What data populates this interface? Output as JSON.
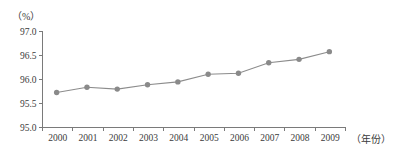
{
  "chart_data": {
    "type": "line",
    "title": "",
    "subtitle": "",
    "xlabel": "（年份）",
    "ylabel": "（%）",
    "categories": [
      "2000",
      "2001",
      "2002",
      "2003",
      "2004",
      "2005",
      "2006",
      "2007",
      "2008",
      "2009"
    ],
    "x": [
      2000,
      2001,
      2002,
      2003,
      2004,
      2005,
      2006,
      2007,
      2008,
      2009
    ],
    "values": [
      95.73,
      95.84,
      95.8,
      95.89,
      95.95,
      96.11,
      96.13,
      96.35,
      96.42,
      96.58
    ],
    "series": [
      {
        "name": "",
        "values": [
          95.73,
          95.84,
          95.8,
          95.89,
          95.95,
          96.11,
          96.13,
          96.35,
          96.42,
          96.58
        ]
      }
    ],
    "ylim": [
      95.0,
      97.0
    ],
    "yticks": [
      "95.0",
      "95.5",
      "96.0",
      "96.5",
      "97.0"
    ],
    "ytick_values": [
      95.0,
      95.5,
      96.0,
      96.5,
      97.0
    ],
    "grid": false,
    "legend": "none",
    "marker": "circle",
    "line_color": "#8c8c8c",
    "marker_color": "#8a8a8a",
    "axis_color": "#7a7a7a",
    "text_color": "#3b3b3b",
    "background": "#ffffff"
  },
  "axes": {
    "y_unit": "（%）",
    "x_unit": "（年份）"
  }
}
